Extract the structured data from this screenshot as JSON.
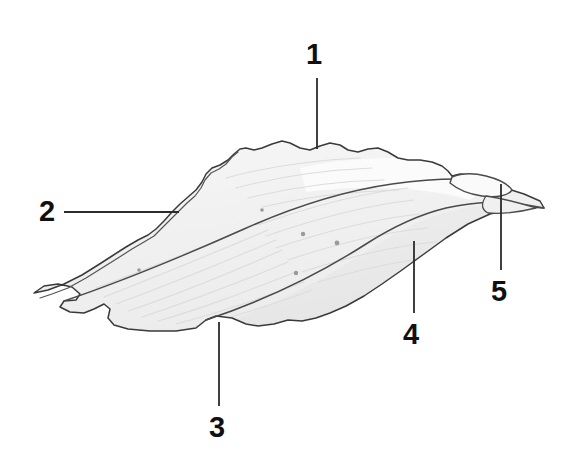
{
  "figure": {
    "kind": "anatomical-line-drawing",
    "background_color": "#ffffff",
    "outline_color": "#3a3a3a",
    "fill_color": "#f3f3f3",
    "shade_color": "#e7e7e7",
    "striation_color": "#dcdcdc",
    "leader_color": "#2b2b2b",
    "label_color": "#101010",
    "canvas": {
      "width": 576,
      "height": 466
    }
  },
  "labels": [
    {
      "id": "1",
      "text": "1",
      "x": 306,
      "y": 40,
      "leader": {
        "type": "vertical",
        "x1": 317,
        "y1": 78,
        "x2": 317,
        "y2": 149
      }
    },
    {
      "id": "2",
      "text": "2",
      "x": 39,
      "y": 197,
      "leader": {
        "type": "horizontal",
        "x1": 64,
        "y1": 212,
        "x2": 179,
        "y2": 212
      }
    },
    {
      "id": "3",
      "text": "3",
      "x": 209,
      "y": 413,
      "leader": {
        "type": "vertical",
        "x1": 219,
        "y1": 406,
        "x2": 219,
        "y2": 322
      }
    },
    {
      "id": "4",
      "text": "4",
      "x": 403,
      "y": 320,
      "leader": {
        "type": "vertical",
        "x1": 414,
        "y1": 313,
        "x2": 414,
        "y2": 241
      }
    },
    {
      "id": "5",
      "text": "5",
      "x": 491,
      "y": 277,
      "leader": {
        "type": "vertical",
        "x1": 501,
        "y1": 270,
        "x2": 501,
        "y2": 184
      }
    }
  ],
  "shape_paths": {
    "body_outline": "M 34 293 L 44 286 L 58 284 L 72 287 L 80 294 L 76 300 L 64 301 L 60 307 L 70 312 L 84 313 L 94 309 L 104 304 L 110 309 L 108 318 L 114 325 L 128 329 L 150 331 L 176 331 L 196 328 L 206 320 L 216 316 L 232 318 L 246 324 L 258 326 L 274 324 L 288 320 L 302 321 L 316 318 L 330 313 L 346 306 L 364 296 L 382 284 L 402 270 L 424 254 L 446 238 L 468 224 L 490 214 L 512 209 L 530 207 L 544 208 L 540 201 L 524 194 L 508 189 L 496 185 L 486 183 L 480 178 L 470 175 L 460 174 L 452 176 L 448 171 L 442 166 L 432 162 L 420 160 L 408 160 L 398 158 L 388 152 L 378 148 L 368 149 L 358 152 L 348 150 L 340 145 L 330 143 L 320 146 L 310 150 L 300 148 L 290 143 L 282 141 L 272 144 L 262 148 L 254 150 L 246 148 L 240 149 L 234 154 L 228 160 L 220 165 L 212 168 L 206 174 L 202 182 L 196 190 L 188 197 L 180 204 L 172 212 L 164 221 L 156 229 L 148 235 L 138 240 L 126 247 L 112 256 L 98 265 L 82 275 L 64 284 L 48 290 Z",
    "rim_line": "M 238 152 L 232 157 L 226 164 L 219 169 L 211 173 L 205 180 L 201 188 L 195 196 L 187 203 L 179 211 L 171 219 L 162 228 L 154 236 L 144 242 L 132 249 L 118 258 L 102 268 L 86 278 L 68 288 L 52 294 L 40 298",
    "interior_divider": "M 64 301 C 120 282 188 254 244 229 C 300 204 350 190 392 184 C 428 179 458 178 480 180",
    "lower_right_curve": "M 206 320 C 260 302 316 276 366 244 C 416 212 470 192 544 208",
    "flap_outline": "M 452 177 C 462 173 474 173 486 176 C 498 179 508 184 512 190 C 508 196 496 198 482 196 C 468 194 456 188 450 183 Z",
    "tip_right": "M 486 196 C 500 198 520 203 536 208 C 520 212 502 214 488 213 C 480 209 482 202 486 196 Z"
  },
  "striations": [
    "M 96 288 C 150 268 210 244 262 222",
    "M 104 297 C 158 276 216 252 268 230",
    "M 116 304 C 168 285 224 262 276 240",
    "M 128 311 C 178 294 232 272 282 250",
    "M 142 317 C 190 301 240 282 288 262",
    "M 158 321 C 204 308 250 290 296 272",
    "M 176 324 C 218 313 262 298 304 282",
    "M 196 326 C 234 317 274 304 312 290",
    "M 258 225 C 312 206 362 193 408 188",
    "M 266 236 C 318 218 368 205 414 200",
    "M 276 248 C 326 231 374 219 420 214",
    "M 288 260 C 336 244 382 232 428 228",
    "M 302 272 C 348 257 392 246 436 242",
    "M 318 282 C 362 269 404 259 446 256",
    "M 226 178 C 270 166 318 160 360 158",
    "M 236 188 C 280 176 328 170 372 168",
    "M 248 198 C 292 187 340 181 384 180",
    "M 262 207 C 306 197 354 191 398 190"
  ],
  "specks": [
    {
      "cx": 303,
      "cy": 234,
      "r": 2.2
    },
    {
      "cx": 337,
      "cy": 243,
      "r": 2.4
    },
    {
      "cx": 296,
      "cy": 273,
      "r": 2.2
    },
    {
      "cx": 262,
      "cy": 210,
      "r": 1.8
    },
    {
      "cx": 139,
      "cy": 270,
      "r": 1.8
    }
  ]
}
